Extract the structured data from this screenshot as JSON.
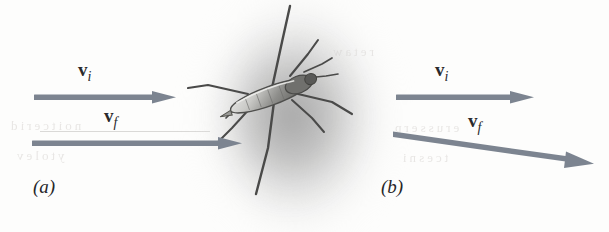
{
  "figure": {
    "type": "physics-vector-diagram",
    "background_color": "#fdfdfc",
    "arrow_color": "#7c8490",
    "ink_color": "#2a2a2c"
  },
  "panels": [
    {
      "id": "a",
      "caption": "(a)",
      "vectors": [
        {
          "name": "v-initial",
          "label_vector": "v",
          "label_subscript": "i",
          "direction": "horizontal-right",
          "angle_deg": 0,
          "start": [
            36,
            97
          ],
          "end": [
            172,
            97
          ]
        },
        {
          "name": "v-final",
          "label_vector": "v",
          "label_subscript": "f",
          "direction": "horizontal-right",
          "angle_deg": 0,
          "start": [
            34,
            143
          ],
          "end": [
            240,
            143
          ]
        }
      ]
    },
    {
      "id": "b",
      "caption": "(b)",
      "vectors": [
        {
          "name": "v-initial",
          "label_vector": "v",
          "label_subscript": "i",
          "direction": "horizontal-right",
          "angle_deg": 0,
          "start": [
            396,
            97
          ],
          "end": [
            528,
            97
          ]
        },
        {
          "name": "v-final",
          "label_vector": "v",
          "label_subscript": "f",
          "direction": "down-right",
          "angle_deg": -8,
          "start": [
            394,
            134
          ],
          "end": [
            596,
            163
          ]
        }
      ]
    }
  ],
  "bleed_through_text": {
    "line1": "noitcerid",
    "line2": "ytolev",
    "line3": "erusserp",
    "line4": "tcesni",
    "line5": "retaw"
  }
}
